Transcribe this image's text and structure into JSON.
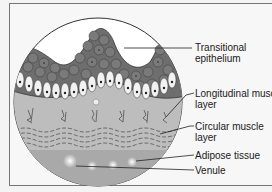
{
  "diagram": {
    "type": "histology cross-section",
    "labels": [
      {
        "id": "transitional-epithelium",
        "line1": "Transitional",
        "line2": "epithelium"
      },
      {
        "id": "longitudinal-muscle",
        "line1": "Longitudinal muscle",
        "line2": "layer"
      },
      {
        "id": "circular-muscle",
        "line1": "Circular  muscle",
        "line2": "layer"
      },
      {
        "id": "adipose-tissue",
        "line1": "Adipose tissue",
        "line2": ""
      },
      {
        "id": "venule",
        "line1": "Venule",
        "line2": ""
      }
    ],
    "colors": {
      "cell_dark": "#6e6e6e",
      "cell_light": "#f2f2f2",
      "tissue": "#bdbdbd",
      "outline": "#333333"
    }
  }
}
